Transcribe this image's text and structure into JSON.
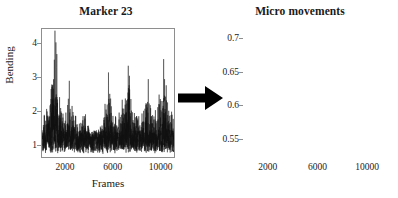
{
  "figure": {
    "width": 398,
    "height": 198,
    "background": "#ffffff",
    "line_color": "#111111",
    "axis_color": "#8e8e8e"
  },
  "arrow": {
    "name": "right-arrow",
    "direction": "right",
    "color": "#000000"
  },
  "panels": {
    "left": {
      "title": "Marker 23",
      "ylabel": "Bending",
      "xlabel": "Frames",
      "yticks": [
        "1",
        "2",
        "3",
        "4"
      ],
      "xticks": [
        "2000",
        "6000",
        "10000"
      ]
    },
    "right": {
      "title": "Micro movements",
      "ylabel": "",
      "xlabel": "Frames",
      "yticks": [
        "0.55",
        "0.6",
        "0.65",
        "0.7"
      ],
      "xticks": [
        "2000",
        "6000",
        "10000"
      ]
    }
  },
  "chart_data": [
    {
      "type": "line",
      "name": "bending-signal",
      "title": "Marker 23",
      "xlabel": "Frames",
      "ylabel": "Bending",
      "xlim": [
        0,
        11200
      ],
      "ylim": [
        0.62,
        4.45
      ],
      "xticks": [
        2000,
        6000,
        10000
      ],
      "yticks": [
        1,
        2,
        3,
        4
      ],
      "grid": false,
      "legend": null,
      "description": "Dense high-frequency noisy bending trace with baseline near 1 and numerous sharp upward spikes; tallest spike about 4.4 near frame 1100.",
      "n_points": 11200,
      "baseline": 1.0,
      "noise_amplitude": 0.45,
      "envelope": [
        {
          "x": 0,
          "y": 1.9
        },
        {
          "x": 600,
          "y": 2.4
        },
        {
          "x": 1100,
          "y": 4.4
        },
        {
          "x": 1500,
          "y": 2.6
        },
        {
          "x": 1900,
          "y": 1.9
        },
        {
          "x": 2300,
          "y": 2.8
        },
        {
          "x": 2700,
          "y": 2.1
        },
        {
          "x": 3100,
          "y": 1.7
        },
        {
          "x": 3600,
          "y": 2.2
        },
        {
          "x": 4000,
          "y": 1.6
        },
        {
          "x": 4400,
          "y": 1.3
        },
        {
          "x": 4800,
          "y": 1.5
        },
        {
          "x": 5200,
          "y": 2.0
        },
        {
          "x": 5600,
          "y": 3.2
        },
        {
          "x": 6000,
          "y": 2.3
        },
        {
          "x": 6400,
          "y": 1.9
        },
        {
          "x": 6900,
          "y": 2.5
        },
        {
          "x": 7300,
          "y": 3.4
        },
        {
          "x": 7700,
          "y": 2.4
        },
        {
          "x": 8100,
          "y": 1.9
        },
        {
          "x": 8600,
          "y": 2.2
        },
        {
          "x": 9000,
          "y": 3.0
        },
        {
          "x": 9400,
          "y": 2.1
        },
        {
          "x": 9800,
          "y": 2.6
        },
        {
          "x": 10300,
          "y": 3.6
        },
        {
          "x": 10800,
          "y": 2.4
        },
        {
          "x": 11200,
          "y": 2.0
        }
      ],
      "peaks": [
        {
          "x": 1100,
          "y": 4.4
        },
        {
          "x": 1180,
          "y": 4.05
        },
        {
          "x": 1260,
          "y": 3.7
        },
        {
          "x": 2320,
          "y": 2.9
        },
        {
          "x": 5640,
          "y": 3.15
        },
        {
          "x": 7320,
          "y": 3.35
        },
        {
          "x": 7420,
          "y": 3.05
        },
        {
          "x": 9020,
          "y": 2.95
        },
        {
          "x": 10320,
          "y": 3.55
        },
        {
          "x": 10400,
          "y": 2.95
        }
      ]
    },
    {
      "type": "line",
      "name": "micro-movements-signal",
      "title": "Micro movements",
      "xlabel": "Frames",
      "ylabel": "",
      "xlim": [
        0,
        11200
      ],
      "ylim": [
        0.522,
        0.715
      ],
      "xticks": [
        2000,
        6000,
        10000
      ],
      "yticks": [
        0.55,
        0.6,
        0.65,
        0.7
      ],
      "grid": false,
      "legend": null,
      "description": "Dense high-frequency oscillation centred on 0.6 with a band roughly 0.535-0.665 and one tall spike reaching about 0.705 near frame 5800.",
      "n_points": 11200,
      "baseline": 0.6,
      "noise_amplitude": 0.035,
      "envelope": [
        {
          "x": 0,
          "y": 0.655
        },
        {
          "x": 500,
          "y": 0.662
        },
        {
          "x": 1000,
          "y": 0.648
        },
        {
          "x": 1500,
          "y": 0.658
        },
        {
          "x": 2000,
          "y": 0.645
        },
        {
          "x": 2500,
          "y": 0.652
        },
        {
          "x": 3000,
          "y": 0.64
        },
        {
          "x": 3500,
          "y": 0.632
        },
        {
          "x": 4000,
          "y": 0.628
        },
        {
          "x": 4500,
          "y": 0.65
        },
        {
          "x": 5000,
          "y": 0.658
        },
        {
          "x": 5500,
          "y": 0.652
        },
        {
          "x": 5800,
          "y": 0.705
        },
        {
          "x": 6100,
          "y": 0.648
        },
        {
          "x": 6600,
          "y": 0.63
        },
        {
          "x": 7100,
          "y": 0.625
        },
        {
          "x": 7600,
          "y": 0.638
        },
        {
          "x": 8100,
          "y": 0.648
        },
        {
          "x": 8600,
          "y": 0.66
        },
        {
          "x": 9100,
          "y": 0.655
        },
        {
          "x": 9600,
          "y": 0.648
        },
        {
          "x": 10100,
          "y": 0.662
        },
        {
          "x": 10600,
          "y": 0.658
        },
        {
          "x": 11200,
          "y": 0.665
        }
      ],
      "peaks": [
        {
          "x": 5800,
          "y": 0.705
        },
        {
          "x": 600,
          "y": 0.663
        },
        {
          "x": 5060,
          "y": 0.66
        },
        {
          "x": 8700,
          "y": 0.662
        },
        {
          "x": 10150,
          "y": 0.664
        },
        {
          "x": 11050,
          "y": 0.666
        }
      ]
    }
  ]
}
